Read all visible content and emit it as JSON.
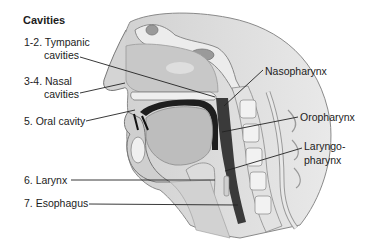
{
  "diagram": {
    "title": "Cavities",
    "colors": {
      "background": "#ffffff",
      "text": "#1c1c1c",
      "leader_line": "#222222",
      "tissue_light": "#d9d9d9",
      "tissue_mid": "#b5b5b5",
      "tissue_dark": "#555555",
      "airway": "#3a3a3a",
      "bone": "#ececec"
    },
    "labels": {
      "tympanic": {
        "line1": "1-2. Tympanic",
        "line2": "cavities"
      },
      "nasal": {
        "line1": "3-4. Nasal",
        "line2": "cavities"
      },
      "oral": {
        "line1": "5. Oral cavity"
      },
      "larynx": {
        "line1": "6. Larynx"
      },
      "esophagus": {
        "line1": "7. Esophagus"
      },
      "nasopharynx": {
        "line1": "Nasopharynx"
      },
      "oropharynx": {
        "line1": "Oropharynx"
      },
      "laryngopharynx": {
        "line1": "Laryngo-",
        "line2": "pharynx"
      }
    }
  }
}
